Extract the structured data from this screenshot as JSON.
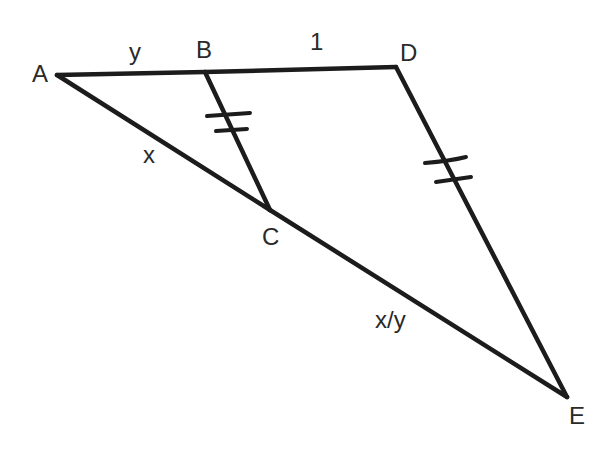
{
  "diagram": {
    "type": "geometry-figure",
    "points": {
      "A": {
        "label": "A"
      },
      "B": {
        "label": "B"
      },
      "C": {
        "label": "C"
      },
      "D": {
        "label": "D"
      },
      "E": {
        "label": "E"
      }
    },
    "segments": [
      {
        "id": "AB",
        "from": "A",
        "to": "B",
        "label": "y"
      },
      {
        "id": "BD",
        "from": "B",
        "to": "D",
        "label": "1"
      },
      {
        "id": "AC",
        "from": "A",
        "to": "C",
        "label": "x"
      },
      {
        "id": "CE",
        "from": "C",
        "to": "E",
        "label": "x/y"
      },
      {
        "id": "BC",
        "from": "B",
        "to": "C",
        "label": "",
        "tick_marks": 2
      },
      {
        "id": "DE",
        "from": "D",
        "to": "E",
        "label": "",
        "tick_marks": 2
      }
    ]
  }
}
